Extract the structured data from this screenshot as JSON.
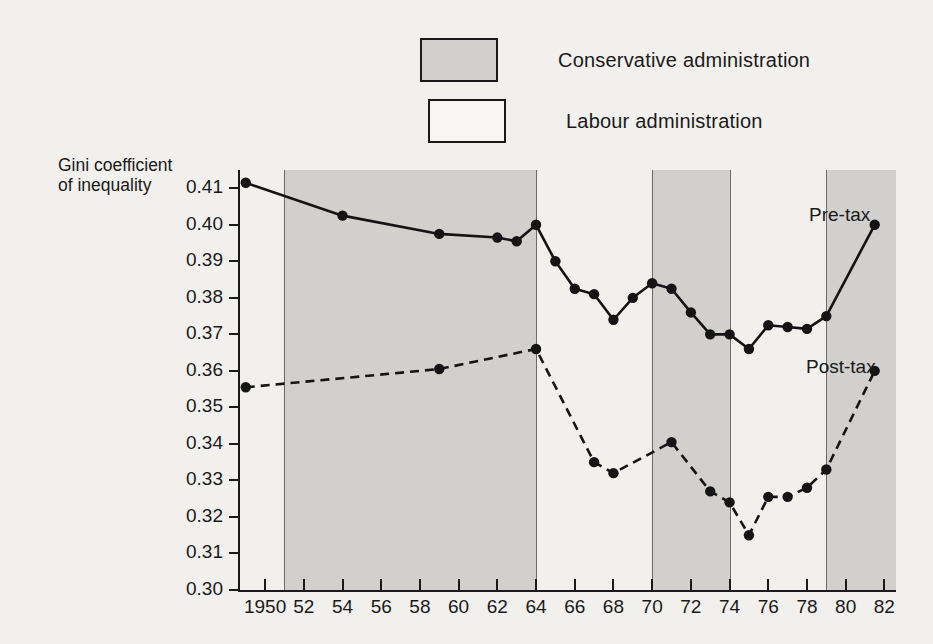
{
  "legend": {
    "items": [
      {
        "label": "Conservative administration",
        "swatch": "shaded",
        "color": "#d2d0cd"
      },
      {
        "label": "Labour administration",
        "swatch": "white",
        "color": "#f7f6f3"
      }
    ]
  },
  "axis_title": {
    "y": "Gini coefficient\nof inequality"
  },
  "annotations": {
    "pre_tax": "Pre-tax",
    "post_tax": "Post-tax"
  },
  "chart_data": {
    "type": "line",
    "title": "",
    "subtitle": "",
    "xlabel": "",
    "ylabel": "Gini coefficient of inequality",
    "ylim": [
      0.3,
      0.415
    ],
    "xlim": [
      1948.6,
      1982.6
    ],
    "grid": false,
    "legend_position": "top-center",
    "ytick_labels": [
      "0.30",
      "0.31",
      "0.32",
      "0.33",
      "0.34",
      "0.35",
      "0.36",
      "0.37",
      "0.38",
      "0.39",
      "0.40",
      "0.41"
    ],
    "ytick_values": [
      0.3,
      0.31,
      0.32,
      0.33,
      0.34,
      0.35,
      0.36,
      0.37,
      0.38,
      0.39,
      0.4,
      0.41
    ],
    "xtick_labels": [
      "1950",
      "52",
      "54",
      "56",
      "58",
      "60",
      "62",
      "64",
      "66",
      "68",
      "70",
      "72",
      "74",
      "76",
      "78",
      "80",
      "82"
    ],
    "xtick_values": [
      1950,
      1952,
      1954,
      1956,
      1958,
      1960,
      1962,
      1964,
      1966,
      1968,
      1970,
      1972,
      1974,
      1976,
      1978,
      1980,
      1982
    ],
    "series": [
      {
        "name": "Pre-tax",
        "style": "solid",
        "x": [
          1949,
          1954,
          1959,
          1962,
          1963,
          1964,
          1965,
          1966,
          1967,
          1968,
          1969,
          1970,
          1971,
          1972,
          1973,
          1974,
          1975,
          1976,
          1977,
          1978,
          1979,
          1981.5
        ],
        "values": [
          0.4115,
          0.4025,
          0.3975,
          0.3965,
          0.3955,
          0.4,
          0.39,
          0.3825,
          0.381,
          0.374,
          0.38,
          0.384,
          0.3825,
          0.376,
          0.37,
          0.37,
          0.366,
          0.3725,
          0.372,
          0.3715,
          0.375,
          0.4
        ]
      },
      {
        "name": "Post-tax",
        "style": "dashed",
        "x": [
          1949,
          1959,
          1964,
          1967,
          1968,
          1971,
          1973,
          1974,
          1975,
          1976,
          1977,
          1978,
          1979,
          1981.5
        ],
        "values": [
          0.3555,
          0.3605,
          0.366,
          0.335,
          0.332,
          0.3405,
          0.327,
          0.324,
          0.315,
          0.3255,
          0.3255,
          0.328,
          0.333,
          0.36
        ]
      }
    ],
    "bands": [
      {
        "label": "Conservative administration",
        "start": 1951.0,
        "end": 1964.0,
        "shaded": true
      },
      {
        "label": "Labour administration",
        "start": 1964.0,
        "end": 1970.0,
        "shaded": false
      },
      {
        "label": "Conservative administration",
        "start": 1970.0,
        "end": 1974.0,
        "shaded": true
      },
      {
        "label": "Labour administration",
        "start": 1974.0,
        "end": 1979.0,
        "shaded": false
      },
      {
        "label": "Conservative administration",
        "start": 1979.0,
        "end": 1982.6,
        "shaded": true
      }
    ]
  }
}
